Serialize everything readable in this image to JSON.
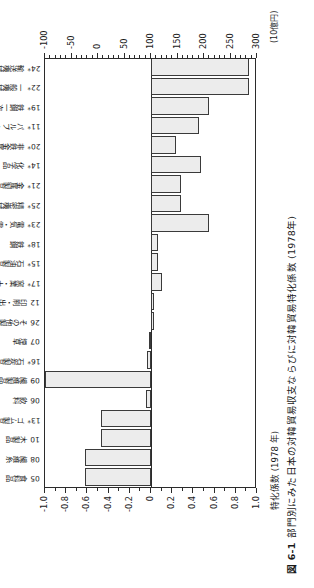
{
  "figure": {
    "number": "図 6-1",
    "caption": "部門別にみた日本の対韓貿易収支ならびに対韓貿易特化係数 (1978年)",
    "left_axis_title": "特化係数 (1978 年)",
    "right_unit": "(10億円)"
  },
  "chart_data": {
    "type": "bar",
    "title": "部門別にみた日本の対韓貿易収支ならびに対韓貿易特化係数 (1978年)",
    "xlabel": "",
    "ylabel": "特化係数 (1978 年)",
    "orientation": "vertical-bars-plotted-downward",
    "grid": false,
    "legend": null,
    "ylim": [
      -1.0,
      1.0
    ],
    "y2lim": [
      -100,
      300
    ],
    "y2label": "(10億円)",
    "yticks": [
      -1.0,
      -0.8,
      -0.6,
      -0.4,
      -0.2,
      0,
      0.2,
      0.4,
      0.6,
      0.8,
      1.0
    ],
    "ytick_labels": [
      "-1.0",
      "-0.8",
      "-0.6",
      "-0.4",
      "-0.2",
      "0",
      "0.2",
      "0.4",
      "0.6",
      "0.8",
      "1.0"
    ],
    "y2ticks": [
      -100,
      -50,
      0,
      50,
      100,
      150,
      200,
      250,
      300
    ],
    "y2tick_labels": [
      "-100",
      "-50",
      "0",
      "50",
      "100",
      "150",
      "200",
      "250",
      "300"
    ],
    "categories": [
      {
        "code": "05",
        "name": "食料品"
      },
      {
        "code": "08",
        "name": "繊維糸"
      },
      {
        "code": "10",
        "name": "木製品"
      },
      {
        "code": "13*",
        "name": "ゴム製品"
      },
      {
        "code": "06",
        "name": "飲料"
      },
      {
        "code": "09",
        "name": "繊維製品"
      },
      {
        "code": "16*",
        "name": "石炭製品"
      },
      {
        "code": "07",
        "name": "煙草"
      },
      {
        "code": "26",
        "name": "その他製造業"
      },
      {
        "code": "12",
        "name": "印刷・出版"
      },
      {
        "code": "17*",
        "name": "窯業・土石"
      },
      {
        "code": "15*",
        "name": "石油製品"
      },
      {
        "code": "18*",
        "name": "鉄鋼"
      },
      {
        "code": "23*",
        "name": "電気・電子機械"
      },
      {
        "code": "25*",
        "name": "精密機械"
      },
      {
        "code": "21*",
        "name": "金属製品"
      },
      {
        "code": "14*",
        "name": "化学品"
      },
      {
        "code": "20*",
        "name": "非鉄金属一次製品"
      },
      {
        "code": "11*",
        "name": "パルプ・紙"
      },
      {
        "code": "19*",
        "name": "鉄鋼一次製品"
      },
      {
        "code": "22*",
        "name": "一般機械"
      },
      {
        "code": "24*",
        "name": "輸送機械"
      }
    ],
    "series": [
      {
        "name": "対韓貿易特化係数",
        "axis": "left",
        "values": [
          -0.62,
          -0.62,
          -0.47,
          -0.47,
          -0.05,
          -1.0,
          -0.04,
          -0.02,
          0.03,
          0.03,
          0.1,
          0.07,
          0.07,
          0.55,
          0.28,
          0.28,
          0.47,
          0.24,
          0.45,
          0.55,
          0.92,
          0.92
        ]
      }
    ],
    "trade_balance": {
      "name": "対韓貿易収支",
      "axis": "right",
      "unit": "10億円",
      "values": [
        -62,
        -62,
        -47,
        -47,
        -5,
        -100,
        -4,
        -2,
        3,
        3,
        10,
        7,
        7,
        110,
        56,
        56,
        95,
        48,
        90,
        110,
        285,
        285
      ]
    }
  }
}
